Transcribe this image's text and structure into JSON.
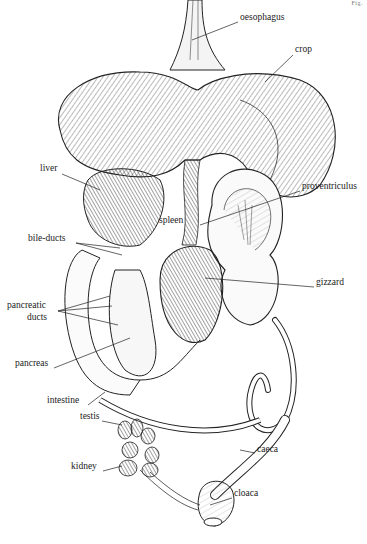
{
  "figure": {
    "corner_mark": "Fig.",
    "labels": [
      {
        "id": "oesophagus",
        "text": "oesophagus",
        "x": 240,
        "y": 17
      },
      {
        "id": "crop",
        "text": "crop",
        "x": 295,
        "y": 49
      },
      {
        "id": "liver",
        "text": "liver",
        "x": 40,
        "y": 168
      },
      {
        "id": "proventriculus",
        "text": "proventriculus",
        "x": 302,
        "y": 186
      },
      {
        "id": "spleen",
        "text": "spleen",
        "x": 159,
        "y": 220
      },
      {
        "id": "bile-ducts",
        "text": "bile-ducts",
        "x": 28,
        "y": 238
      },
      {
        "id": "gizzard",
        "text": "gizzard",
        "x": 316,
        "y": 282
      },
      {
        "id": "pancreatic-ducts-1",
        "text": "pancreatic",
        "x": 7,
        "y": 305
      },
      {
        "id": "pancreatic-ducts-2",
        "text": "ducts",
        "x": 27,
        "y": 317
      },
      {
        "id": "pancreas",
        "text": "pancreas",
        "x": 15,
        "y": 363
      },
      {
        "id": "intestine",
        "text": "intestine",
        "x": 47,
        "y": 400
      },
      {
        "id": "testis",
        "text": "testis",
        "x": 80,
        "y": 416
      },
      {
        "id": "caeca",
        "text": "caeca",
        "x": 257,
        "y": 449
      },
      {
        "id": "kidney",
        "text": "kidney",
        "x": 71,
        "y": 466
      },
      {
        "id": "cloaca",
        "text": "cloaca",
        "x": 234,
        "y": 493
      }
    ]
  }
}
